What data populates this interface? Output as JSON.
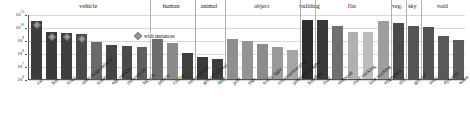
{
  "chart_data": {
    "type": "bar",
    "title": "",
    "xlabel": "",
    "ylabel": "",
    "yscale": "log",
    "ylim": [
      1000000,
      100000000000
    ],
    "grid": true,
    "legend": {
      "position": "top-left-inset",
      "entries": [
        {
          "label": "with instances",
          "marker": "diamond",
          "color": "#9a9a9a"
        }
      ]
    },
    "y_ticks": [
      {
        "value": 100000000000,
        "label": "10",
        "exp": "11"
      },
      {
        "value": 10000000000,
        "label": "10",
        "exp": "10"
      },
      {
        "value": 1000000000,
        "label": "10",
        "exp": "9"
      },
      {
        "value": 100000000,
        "label": "10",
        "exp": "8"
      },
      {
        "value": 10000000,
        "label": "10",
        "exp": "7"
      },
      {
        "value": 1000000,
        "label": "10",
        "exp": "6"
      }
    ],
    "groups": [
      {
        "name": "vehicle",
        "start": 0,
        "end": 7
      },
      {
        "name": "human",
        "start": 8,
        "end": 10
      },
      {
        "name": "animal",
        "start": 11,
        "end": 12
      },
      {
        "name": "object",
        "start": 13,
        "end": 17
      },
      {
        "name": "building",
        "start": 18,
        "end": 18
      },
      {
        "name": "flat",
        "start": 19,
        "end": 23
      },
      {
        "name": "veg.",
        "start": 24,
        "end": 24
      },
      {
        "name": "sky",
        "start": 25,
        "end": 25
      },
      {
        "name": "void",
        "start": 26,
        "end": 28
      }
    ],
    "categories": [
      "car",
      "bus",
      "truck",
      "other large vehicle",
      "trailer",
      "ego vehicle",
      "motorcycle",
      "bicycle",
      "person",
      "cyclist",
      "motorcyclist",
      "ground animal",
      "bird",
      "pole",
      "sign",
      "traffic light",
      "construction cone",
      "pedestrian object",
      "building",
      "road",
      "sidewalk",
      "road marking",
      "lane marking",
      "vegetation",
      "sky",
      "ground",
      "static",
      "dynamic",
      "water"
    ],
    "values": [
      31000000000,
      3800000000,
      3600000000,
      2700000000,
      760000000,
      420000000,
      330000000,
      310000000,
      2100000000,
      580000000,
      100000000,
      49000000,
      33000000,
      1200000000,
      780000000,
      470000000,
      300000000,
      180000000,
      36000000000,
      33000000000,
      13000000000,
      4400000000,
      4100000000,
      27000000000,
      22000000000,
      11000000000,
      9800000000,
      1900000000,
      1000000000
    ],
    "bar_colors": [
      "#3c3c3c",
      "#3a3a3a",
      "#3e3e3e",
      "#4a4a4a",
      "#6a6a6a",
      "#454545",
      "#4a4a4a",
      "#5e5e5e",
      "#6e6e6e",
      "#8a8a8a",
      "#3f3f3f",
      "#3a3a3a",
      "#3d3d3d",
      "#8f8f8f",
      "#949494",
      "#8c8c8c",
      "#9a9a9a",
      "#a5a5a5",
      "#2e2e2e",
      "#3a3a3a",
      "#707070",
      "#b0b0b0",
      "#bcbcbc",
      "#9e9e9e",
      "#4a4a4a",
      "#555555",
      "#525252",
      "#595959",
      "#5c5c5c"
    ],
    "with_instances": [
      true,
      true,
      true,
      true,
      false,
      false,
      false,
      false,
      false,
      false,
      false,
      false,
      false,
      false,
      false,
      false,
      false,
      false,
      false,
      false,
      false,
      false,
      false,
      false,
      false,
      false,
      false,
      false,
      false
    ]
  }
}
